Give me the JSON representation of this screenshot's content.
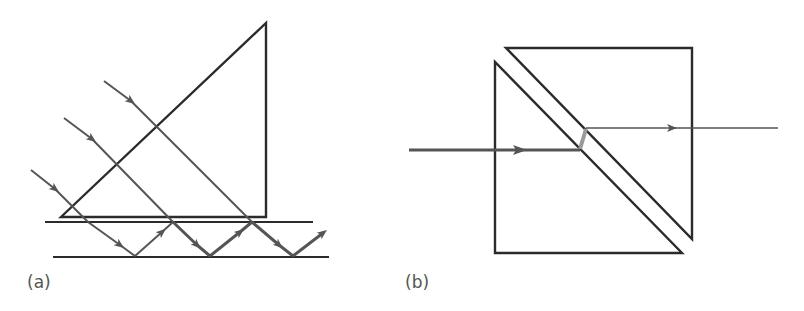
{
  "figure": {
    "panels": [
      {
        "id": "a",
        "label": "(a)",
        "description": "Right-angle prism on top of a slab; three parallel rays enter the prism hypotenuse, exit the base, and zigzag by total internal reflection between two parallel surfaces."
      },
      {
        "id": "b",
        "label": "(b)",
        "description": "Beam-splitter cube made of two right-angle prisms separated by a thin gap; an incoming ray crosses the gap and exits to the right."
      }
    ],
    "colors": {
      "outline": "#2b2b2b",
      "ray": "#555555",
      "gap_ray": "#9a9a9a",
      "background": "#ffffff"
    }
  }
}
